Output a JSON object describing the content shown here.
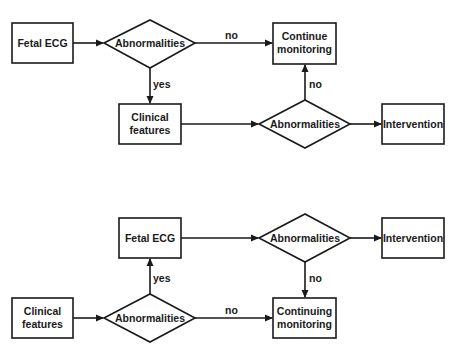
{
  "diagrams": [
    {
      "nodes": {
        "fetal_ecg": {
          "label": "Fetal ECG"
        },
        "decision1": {
          "label": "Abnormalities"
        },
        "continue": {
          "line1": "Continue",
          "line2": "monitoring"
        },
        "clinical": {
          "line1": "Clinical",
          "line2": "features"
        },
        "decision2": {
          "label": "Abnormalities"
        },
        "intervention": {
          "label": "Intervention"
        }
      },
      "edges": {
        "d1_no": "no",
        "d1_yes": "yes",
        "d2_no": "no"
      }
    },
    {
      "nodes": {
        "fetal_ecg": {
          "label": "Fetal ECG"
        },
        "decision1": {
          "label": "Abnormalities"
        },
        "intervention": {
          "label": "Intervention"
        },
        "clinical": {
          "line1": "Clinical",
          "line2": "features"
        },
        "decision2": {
          "label": "Abnormalities"
        },
        "continue": {
          "line1": "Continuing",
          "line2": "monitoring"
        }
      },
      "edges": {
        "d1_no": "no",
        "d2_yes": "yes",
        "d2_no": "no"
      }
    }
  ],
  "colors": {
    "stroke": "#1a1a1a",
    "background": "#ffffff"
  }
}
